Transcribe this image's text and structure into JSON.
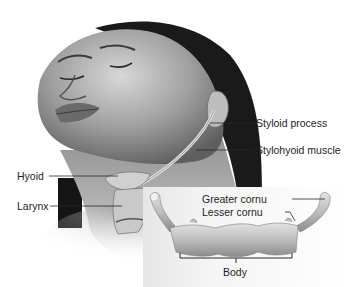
{
  "figure": {
    "colors": {
      "background": "#ffffff",
      "skin_light": "#d9d9d9",
      "skin_mid": "#a8a8a8",
      "skin_dark": "#6e6e6e",
      "hair": "#1a1a1a",
      "bone": "#cfcfcf",
      "bone_shadow": "#8c8c8c",
      "label_text": "#1e1e1e",
      "leader_line": "#2a2a2a"
    }
  },
  "labels": {
    "styloid_process": "Styloid process",
    "stylohyoid_muscle": "Stylohyoid muscle",
    "hyoid": "Hyoid",
    "larynx": "Larynx",
    "greater_cornu": "Greater cornu",
    "lesser_cornu": "Lesser cornu",
    "body": "Body"
  }
}
